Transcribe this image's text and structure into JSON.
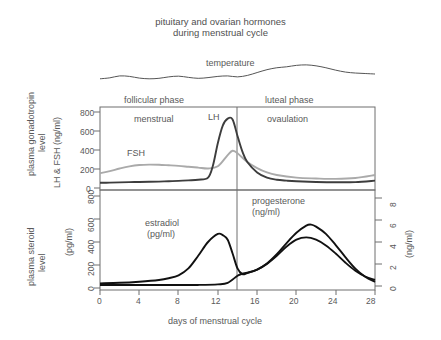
{
  "title": {
    "line1": "pituitary and ovarian hormones",
    "line2": "during menstrual cycle"
  },
  "annotations": {
    "temperature": "temperature",
    "follicular_phase": "follicular phase",
    "luteal_phase": "luteal phase",
    "menstrual": "menstrual",
    "ovulation": "ovaulation",
    "lh": "LH",
    "fsh": "FSH",
    "estradiol_name": "estradiol",
    "estradiol_unit": "(pg/ml)",
    "progesterone_name": "progesterone",
    "progesterone_unit": "(ng/ml)"
  },
  "axis_titles": {
    "plasma_gonadotropin_level": "plasma gonadotropin\nlevel",
    "plasma_steroid_level": "plasma steroid\nlevel",
    "upper_y": "LH & FSH (ng/ml)",
    "lower_y_left": "(pg/ml)",
    "lower_y_right": "(ng/ml)",
    "x": "days of menstrual cycle"
  },
  "ticks": {
    "upper_y": [
      "0",
      "200",
      "400",
      "600",
      "800"
    ],
    "lower_y_left": [
      "0",
      "200",
      "400",
      "600",
      "800"
    ],
    "lower_y_right": [
      "0",
      "2",
      "4",
      "6",
      "8"
    ],
    "x": [
      "0",
      "4",
      "8",
      "12",
      "16",
      "20",
      "24",
      "28"
    ]
  },
  "colors": {
    "lh": "#3d3d3d",
    "fsh": "#aaaaaa",
    "estradiol": "#111111",
    "progesterone": "#111111",
    "temperature": "#555555",
    "frame": "#6e6e6e",
    "text": "#595959"
  },
  "chart_data": {
    "type": "line",
    "title": "pituitary and ovarian hormones during menstrual cycle",
    "xlabel": "days of menstrual cycle",
    "xlim": [
      0,
      28
    ],
    "xticks": [
      0,
      4,
      8,
      12,
      16,
      20,
      24,
      28
    ],
    "grid": false,
    "legend": "inline-labels",
    "ovulation_day": 14,
    "panels": [
      {
        "name": "upper",
        "ylabel": "LH & FSH (ng/ml)",
        "side_label": "plasma gonadotropin level",
        "ylim": [
          0,
          900
        ],
        "yticks": [
          0,
          200,
          400,
          600,
          800
        ],
        "phase_labels": [
          "follicular phase",
          "luteal phase",
          "menstrual",
          "ovaulation"
        ],
        "series": [
          {
            "name": "LH",
            "color": "#3d3d3d",
            "x": [
              0,
              1,
              2,
              3,
              4,
              5,
              6,
              7,
              8,
              9,
              10,
              11,
              11.5,
              12,
              12.5,
              13,
              13.5,
              14,
              14.5,
              15,
              16,
              17,
              18,
              19,
              20,
              22,
              24,
              26,
              28
            ],
            "y": [
              60,
              62,
              65,
              68,
              70,
              72,
              74,
              78,
              82,
              88,
              95,
              120,
              260,
              520,
              720,
              800,
              790,
              600,
              420,
              300,
              180,
              120,
              95,
              85,
              78,
              70,
              66,
              68,
              85
            ]
          },
          {
            "name": "FSH",
            "color": "#aaaaaa",
            "x": [
              0,
              1,
              2,
              3,
              4,
              5,
              6,
              7,
              8,
              9,
              10,
              11,
              12,
              13,
              13.5,
              14,
              15,
              16,
              17,
              18,
              20,
              22,
              24,
              26,
              28
            ],
            "y": [
              170,
              195,
              225,
              250,
              265,
              270,
              268,
              262,
              255,
              245,
              235,
              225,
              250,
              380,
              430,
              400,
              300,
              230,
              180,
              150,
              120,
              110,
              105,
              115,
              150
            ]
          }
        ]
      },
      {
        "name": "lower",
        "ylabel_left": "(pg/ml)",
        "ylabel_right": "(ng/ml)",
        "side_label": "plasma steroid level",
        "ylim_left": [
          0,
          800
        ],
        "yticks_left": [
          0,
          200,
          400,
          600,
          800
        ],
        "ylim_right": [
          0,
          9
        ],
        "yticks_right": [
          0,
          2,
          4,
          6,
          8
        ],
        "series": [
          {
            "name": "estradiol",
            "unit": "pg/ml",
            "color": "#111111",
            "x": [
              0,
              2,
              4,
              6,
              7,
              8,
              9,
              10,
              11,
              12,
              12.5,
              13,
              13.5,
              14,
              14.5,
              15,
              16,
              17,
              18,
              19,
              20,
              21,
              22,
              23,
              24,
              25,
              26,
              27,
              28
            ],
            "y": [
              40,
              45,
              55,
              70,
              85,
              110,
              170,
              280,
              400,
              470,
              460,
              420,
              300,
              170,
              120,
              130,
              160,
              210,
              280,
              360,
              420,
              440,
              420,
              370,
              300,
              220,
              150,
              100,
              70
            ]
          },
          {
            "name": "progesterone",
            "unit": "ng/ml",
            "color": "#111111",
            "x": [
              0,
              2,
              4,
              6,
              8,
              10,
              12,
              13,
              14,
              14.5,
              15,
              16,
              17,
              18,
              19,
              20,
              21,
              21.5,
              22,
              23,
              24,
              25,
              26,
              27,
              28
            ],
            "y": [
              0.3,
              0.3,
              0.3,
              0.3,
              0.3,
              0.3,
              0.35,
              0.5,
              1.2,
              1.4,
              1.5,
              1.8,
              2.4,
              3.3,
              4.4,
              5.4,
              6.1,
              6.2,
              6.0,
              5.3,
              4.2,
              3.0,
              1.9,
              1.1,
              0.6
            ]
          }
        ]
      },
      {
        "name": "temperature",
        "series": [
          {
            "name": "temperature",
            "color": "#555555",
            "x": [
              0,
              1,
              2,
              3,
              4,
              5,
              6,
              7,
              8,
              9,
              10,
              11,
              12,
              13,
              14,
              15,
              16,
              17,
              18,
              19,
              20,
              21,
              22,
              23,
              24,
              25,
              26,
              27,
              28
            ],
            "y": [
              0.3,
              0.34,
              0.42,
              0.4,
              0.33,
              0.3,
              0.32,
              0.38,
              0.41,
              0.36,
              0.32,
              0.35,
              0.4,
              0.42,
              0.38,
              0.44,
              0.56,
              0.68,
              0.76,
              0.8,
              0.86,
              0.88,
              0.84,
              0.76,
              0.66,
              0.58,
              0.54,
              0.52,
              0.5
            ]
          }
        ]
      }
    ]
  }
}
